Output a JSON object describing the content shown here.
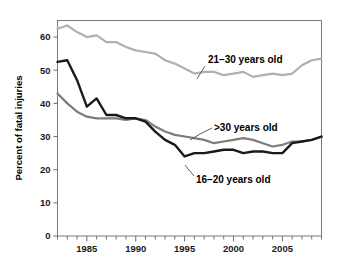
{
  "chart_data": {
    "type": "line",
    "title": "",
    "xlabel": "",
    "ylabel": "Percent of fatal injuries",
    "xlim": [
      1982,
      2009
    ],
    "ylim": [
      0,
      65
    ],
    "grid": false,
    "legend_position": "inline-annotations",
    "y_ticks": [
      0,
      10,
      20,
      30,
      40,
      50,
      60
    ],
    "y_tick_labels": [
      "0",
      "10",
      "20",
      "30",
      "40",
      "50",
      "60"
    ],
    "x_ticks": [
      1982,
      1983,
      1984,
      1985,
      1986,
      1987,
      1988,
      1989,
      1990,
      1991,
      1992,
      1993,
      1994,
      1995,
      1996,
      1997,
      1998,
      1999,
      2000,
      2001,
      2002,
      2003,
      2004,
      2005,
      2006,
      2007,
      2008,
      2009
    ],
    "x_tick_labels_shown": [
      "1985",
      "1990",
      "1995",
      "2000",
      "2005"
    ],
    "x_labeled_ticks": [
      1985,
      1990,
      1995,
      2000,
      2005
    ],
    "x": [
      1982,
      1983,
      1984,
      1985,
      1986,
      1987,
      1988,
      1989,
      1990,
      1991,
      1992,
      1993,
      1994,
      1995,
      1996,
      1997,
      1998,
      1999,
      2000,
      2001,
      2002,
      2003,
      2004,
      2005,
      2006,
      2007,
      2008,
      2009
    ],
    "series": [
      {
        "name": "21-30 years old",
        "label": "21–30 years old",
        "color": "#b0b0b0",
        "width": 2.2,
        "values": [
          62.5,
          63.5,
          61.5,
          60.0,
          60.5,
          58.5,
          58.5,
          57.0,
          56.0,
          55.5,
          55.0,
          53.0,
          52.0,
          50.5,
          49.0,
          49.5,
          49.5,
          48.5,
          49.0,
          49.5,
          48.0,
          48.5,
          49.0,
          48.5,
          49.0,
          51.5,
          53.0,
          53.5
        ]
      },
      {
        "name": ">30 years old",
        "label": ">30 years old",
        "color": "#7d7d7d",
        "width": 2.2,
        "values": [
          43.0,
          40.0,
          37.5,
          36.0,
          35.5,
          35.5,
          35.5,
          35.0,
          35.5,
          35.0,
          33.0,
          31.5,
          30.5,
          30.0,
          29.5,
          29.0,
          28.0,
          28.5,
          29.0,
          29.5,
          29.0,
          28.0,
          27.0,
          27.5,
          28.5,
          28.5,
          29.0,
          30.0
        ]
      },
      {
        "name": "16-20 years old",
        "label": "16–20 years old",
        "color": "#1a1a1a",
        "width": 2.4,
        "values": [
          52.5,
          53.0,
          47.0,
          39.0,
          41.5,
          36.5,
          36.5,
          35.5,
          35.5,
          34.5,
          31.5,
          29.0,
          27.5,
          24.0,
          25.0,
          25.0,
          25.5,
          26.0,
          26.0,
          25.0,
          25.5,
          25.5,
          25.0,
          25.0,
          28.0,
          28.5,
          29.0,
          30.0
        ]
      }
    ],
    "annotations": [
      {
        "text": "21–30 years old",
        "x_text": 208,
        "y_text": 63,
        "leader": "M205,66 L200,74 L197,79"
      },
      {
        "text": ">30 years old",
        "x_text": 214,
        "y_text": 131,
        "leader": "M212,128 L200,134 L190,140"
      },
      {
        "text": "16–20 years old",
        "x_text": 196,
        "y_text": 183,
        "leader": "M194,176 L189,170 L185,165"
      }
    ]
  }
}
